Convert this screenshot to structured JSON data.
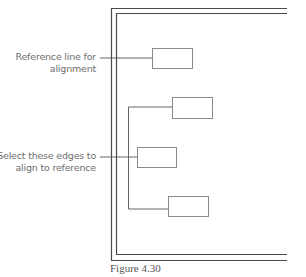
{
  "figure": {
    "caption": "Figure 4.30",
    "colors": {
      "frame": "#4a4a4a",
      "box_stroke": "#8a8a8a",
      "connector": "#555555",
      "label_text": "#6e6e6e",
      "background": "#ffffff"
    },
    "callouts": [
      {
        "id": "reference",
        "line1": "Reference line for",
        "line2": "alignment"
      },
      {
        "id": "select-edges",
        "line1": "Select these edges to",
        "line2": "align to reference"
      }
    ],
    "boxes": [
      {
        "name": "reference-box",
        "x": 152,
        "y": 48,
        "w": 40,
        "h": 20
      },
      {
        "name": "box-top",
        "x": 172,
        "y": 97,
        "w": 40,
        "h": 21
      },
      {
        "name": "box-middle",
        "x": 137,
        "y": 147,
        "w": 39,
        "h": 20
      },
      {
        "name": "box-bottom",
        "x": 168,
        "y": 196,
        "w": 40,
        "h": 20
      }
    ]
  }
}
